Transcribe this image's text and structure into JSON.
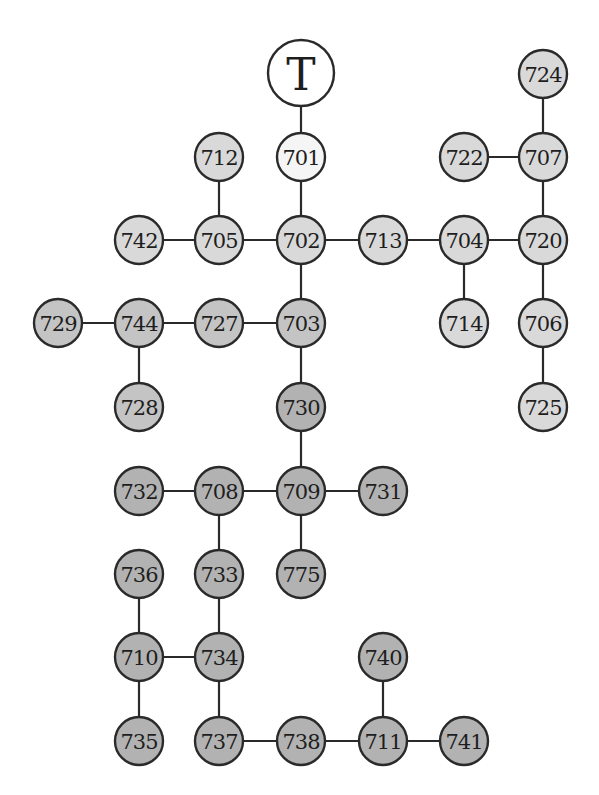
{
  "diagram": {
    "type": "tree",
    "root": {
      "id": "T",
      "label": "T",
      "x": 301,
      "y": 73,
      "r": 33,
      "fill": "#ffffff"
    },
    "colors": {
      "white": "#f5f5f5",
      "light": "#d9d9d9",
      "mid": "#c4c4c4",
      "dark": "#b2b2b2",
      "stroke": "#2a2a2a"
    },
    "nodes": [
      {
        "id": "701",
        "label": "701",
        "x": 301,
        "y": 157,
        "shade": "white"
      },
      {
        "id": "712",
        "label": "712",
        "x": 219,
        "y": 157,
        "shade": "light"
      },
      {
        "id": "722",
        "label": "722",
        "x": 464,
        "y": 157,
        "shade": "light"
      },
      {
        "id": "724",
        "label": "724",
        "x": 543,
        "y": 74,
        "shade": "light"
      },
      {
        "id": "707",
        "label": "707",
        "x": 543,
        "y": 157,
        "shade": "light"
      },
      {
        "id": "742",
        "label": "742",
        "x": 139,
        "y": 240,
        "shade": "light"
      },
      {
        "id": "705",
        "label": "705",
        "x": 219,
        "y": 240,
        "shade": "light"
      },
      {
        "id": "702",
        "label": "702",
        "x": 301,
        "y": 240,
        "shade": "light"
      },
      {
        "id": "713",
        "label": "713",
        "x": 383,
        "y": 240,
        "shade": "light"
      },
      {
        "id": "704",
        "label": "704",
        "x": 464,
        "y": 240,
        "shade": "light"
      },
      {
        "id": "720",
        "label": "720",
        "x": 543,
        "y": 240,
        "shade": "light"
      },
      {
        "id": "729",
        "label": "729",
        "x": 58,
        "y": 323,
        "shade": "mid"
      },
      {
        "id": "744",
        "label": "744",
        "x": 139,
        "y": 323,
        "shade": "mid"
      },
      {
        "id": "727",
        "label": "727",
        "x": 219,
        "y": 323,
        "shade": "mid"
      },
      {
        "id": "703",
        "label": "703",
        "x": 301,
        "y": 323,
        "shade": "mid"
      },
      {
        "id": "714",
        "label": "714",
        "x": 464,
        "y": 323,
        "shade": "light"
      },
      {
        "id": "706",
        "label": "706",
        "x": 543,
        "y": 323,
        "shade": "light"
      },
      {
        "id": "728",
        "label": "728",
        "x": 139,
        "y": 407,
        "shade": "mid"
      },
      {
        "id": "730",
        "label": "730",
        "x": 301,
        "y": 407,
        "shade": "dark"
      },
      {
        "id": "725",
        "label": "725",
        "x": 543,
        "y": 407,
        "shade": "light"
      },
      {
        "id": "732",
        "label": "732",
        "x": 139,
        "y": 491,
        "shade": "dark"
      },
      {
        "id": "708",
        "label": "708",
        "x": 219,
        "y": 491,
        "shade": "dark"
      },
      {
        "id": "709",
        "label": "709",
        "x": 301,
        "y": 491,
        "shade": "dark"
      },
      {
        "id": "731",
        "label": "731",
        "x": 383,
        "y": 491,
        "shade": "dark"
      },
      {
        "id": "736",
        "label": "736",
        "x": 139,
        "y": 574,
        "shade": "dark"
      },
      {
        "id": "733",
        "label": "733",
        "x": 219,
        "y": 574,
        "shade": "dark"
      },
      {
        "id": "775",
        "label": "775",
        "x": 301,
        "y": 574,
        "shade": "dark"
      },
      {
        "id": "710",
        "label": "710",
        "x": 139,
        "y": 657,
        "shade": "dark"
      },
      {
        "id": "734",
        "label": "734",
        "x": 219,
        "y": 657,
        "shade": "dark"
      },
      {
        "id": "740",
        "label": "740",
        "x": 383,
        "y": 657,
        "shade": "dark"
      },
      {
        "id": "735",
        "label": "735",
        "x": 139,
        "y": 741,
        "shade": "dark"
      },
      {
        "id": "737",
        "label": "737",
        "x": 219,
        "y": 741,
        "shade": "dark"
      },
      {
        "id": "738",
        "label": "738",
        "x": 301,
        "y": 741,
        "shade": "dark"
      },
      {
        "id": "711",
        "label": "711",
        "x": 383,
        "y": 741,
        "shade": "dark"
      },
      {
        "id": "741",
        "label": "741",
        "x": 464,
        "y": 741,
        "shade": "dark"
      }
    ],
    "node_radius": 24,
    "edges": [
      [
        "T",
        "701"
      ],
      [
        "701",
        "702"
      ],
      [
        "712",
        "705"
      ],
      [
        "742",
        "705"
      ],
      [
        "705",
        "702"
      ],
      [
        "702",
        "713"
      ],
      [
        "713",
        "704"
      ],
      [
        "704",
        "720"
      ],
      [
        "704",
        "714"
      ],
      [
        "724",
        "707"
      ],
      [
        "722",
        "707"
      ],
      [
        "707",
        "720"
      ],
      [
        "720",
        "706"
      ],
      [
        "706",
        "725"
      ],
      [
        "702",
        "703"
      ],
      [
        "729",
        "744"
      ],
      [
        "744",
        "727"
      ],
      [
        "727",
        "703"
      ],
      [
        "744",
        "728"
      ],
      [
        "703",
        "730"
      ],
      [
        "730",
        "709"
      ],
      [
        "732",
        "708"
      ],
      [
        "708",
        "709"
      ],
      [
        "709",
        "731"
      ],
      [
        "709",
        "775"
      ],
      [
        "708",
        "733"
      ],
      [
        "733",
        "734"
      ],
      [
        "736",
        "710"
      ],
      [
        "710",
        "734"
      ],
      [
        "710",
        "735"
      ],
      [
        "734",
        "737"
      ],
      [
        "737",
        "738"
      ],
      [
        "738",
        "711"
      ],
      [
        "740",
        "711"
      ],
      [
        "711",
        "741"
      ]
    ]
  }
}
